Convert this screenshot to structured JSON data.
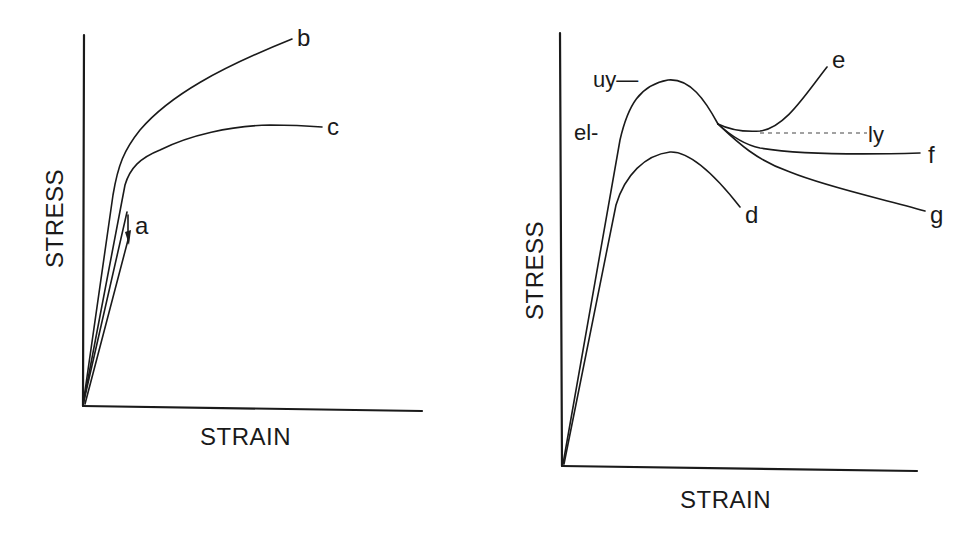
{
  "figure": {
    "background": "#ffffff",
    "ink_color": "#1a1a1a",
    "panels": [
      {
        "id": "left",
        "x_axis_label": "STRAIN",
        "y_axis_label": "STRESS",
        "curves": [
          {
            "id": "a",
            "label": "a",
            "description": "linear elastic loading/unloading (arrow)"
          },
          {
            "id": "b",
            "label": "b",
            "description": "strain hardening curve rising continuously"
          },
          {
            "id": "c",
            "label": "c",
            "description": "curve yielding then plateauing"
          }
        ]
      },
      {
        "id": "right",
        "x_axis_label": "STRAIN",
        "y_axis_label": "STRESS",
        "markers": [
          {
            "id": "uy",
            "label": "uy—",
            "description": "upper yield point"
          },
          {
            "id": "el",
            "label": "el-",
            "description": "elastic limit"
          },
          {
            "id": "ly",
            "label": "ly",
            "description": "lower yield (dashed line)"
          }
        ],
        "curves": [
          {
            "id": "d",
            "label": "d",
            "description": "lower curve peak then drop"
          },
          {
            "id": "e",
            "label": "e",
            "description": "drop then strain hardening upward"
          },
          {
            "id": "f",
            "label": "f",
            "description": "drop then flat plateau"
          },
          {
            "id": "g",
            "label": "g",
            "description": "drop then continued softening"
          }
        ]
      }
    ]
  }
}
